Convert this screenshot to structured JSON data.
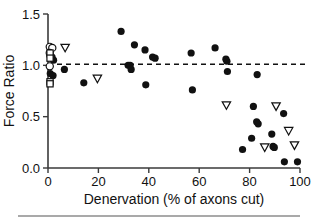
{
  "figure": {
    "background": "#ffffff",
    "foreground": "#111111",
    "axis_color": "#3a3a3a",
    "footer_rule_color": "#8d8d8d"
  },
  "chart_data": {
    "type": "scatter",
    "title": "",
    "xlabel": "Denervation (% of axons cut)",
    "ylabel": "Force Ratio",
    "xlim": [
      0,
      100
    ],
    "ylim": [
      0.0,
      1.5
    ],
    "xticks": [
      0,
      20,
      40,
      60,
      80,
      100
    ],
    "xticklabels": [
      "0",
      "20",
      "40",
      "60",
      "80",
      "100"
    ],
    "yticks": [
      0.0,
      0.5,
      1.0,
      1.5
    ],
    "yticklabels": [
      "0.0",
      "0.5",
      "1.0",
      "1.5"
    ],
    "grid": false,
    "legend": null,
    "annotations": [
      {
        "type": "hline",
        "name": "reference-line-unity",
        "y": 1.01,
        "style": "dashed",
        "color": "#111111"
      }
    ],
    "series": [
      {
        "name": "filled-circle",
        "marker": "filled-circle",
        "color": "#111111",
        "points": [
          {
            "x": 0.8,
            "y": 1.09
          },
          {
            "x": 1.6,
            "y": 1.08
          },
          {
            "x": 2.2,
            "y": 1.05
          },
          {
            "x": 0.9,
            "y": 0.92
          },
          {
            "x": 2.0,
            "y": 0.9
          },
          {
            "x": 6.5,
            "y": 0.96
          },
          {
            "x": 14.2,
            "y": 0.83
          },
          {
            "x": 29.0,
            "y": 1.33
          },
          {
            "x": 31.8,
            "y": 1.0
          },
          {
            "x": 32.6,
            "y": 1.0
          },
          {
            "x": 33.0,
            "y": 0.96
          },
          {
            "x": 34.3,
            "y": 1.2
          },
          {
            "x": 38.5,
            "y": 1.15
          },
          {
            "x": 38.8,
            "y": 0.81
          },
          {
            "x": 41.5,
            "y": 1.08
          },
          {
            "x": 42.5,
            "y": 1.07
          },
          {
            "x": 56.8,
            "y": 1.12
          },
          {
            "x": 57.3,
            "y": 0.76
          },
          {
            "x": 66.3,
            "y": 1.17
          },
          {
            "x": 70.6,
            "y": 1.06
          },
          {
            "x": 71.0,
            "y": 1.04
          },
          {
            "x": 71.2,
            "y": 0.94
          },
          {
            "x": 77.2,
            "y": 0.18
          },
          {
            "x": 80.8,
            "y": 0.29
          },
          {
            "x": 81.5,
            "y": 0.6
          },
          {
            "x": 82.8,
            "y": 0.45
          },
          {
            "x": 83.4,
            "y": 0.43
          },
          {
            "x": 83.0,
            "y": 0.91
          },
          {
            "x": 88.8,
            "y": 0.33
          },
          {
            "x": 89.3,
            "y": 0.21
          },
          {
            "x": 89.8,
            "y": 0.2
          },
          {
            "x": 93.5,
            "y": 0.53
          },
          {
            "x": 93.8,
            "y": 0.06
          },
          {
            "x": 99.0,
            "y": 0.06
          }
        ]
      },
      {
        "name": "open-circle",
        "marker": "open-circle",
        "color": "#111111",
        "points": [
          {
            "x": 0.7,
            "y": 1.18
          },
          {
            "x": 1.7,
            "y": 1.17
          },
          {
            "x": 0.7,
            "y": 1.12
          },
          {
            "x": 0.7,
            "y": 0.99
          }
        ]
      },
      {
        "name": "open-square",
        "marker": "open-square",
        "color": "#111111",
        "points": [
          {
            "x": 0.8,
            "y": 1.12
          },
          {
            "x": 0.8,
            "y": 1.07
          },
          {
            "x": 0.8,
            "y": 0.84
          },
          {
            "x": 0.8,
            "y": 0.82
          }
        ]
      },
      {
        "name": "open-triangle-down",
        "marker": "open-triangle-down",
        "color": "#111111",
        "points": [
          {
            "x": 6.8,
            "y": 1.17
          },
          {
            "x": 19.6,
            "y": 0.87
          },
          {
            "x": 70.8,
            "y": 0.61
          },
          {
            "x": 86.0,
            "y": 0.2
          },
          {
            "x": 90.5,
            "y": 0.6
          },
          {
            "x": 95.5,
            "y": 0.36
          },
          {
            "x": 97.8,
            "y": 0.22
          }
        ]
      }
    ]
  }
}
